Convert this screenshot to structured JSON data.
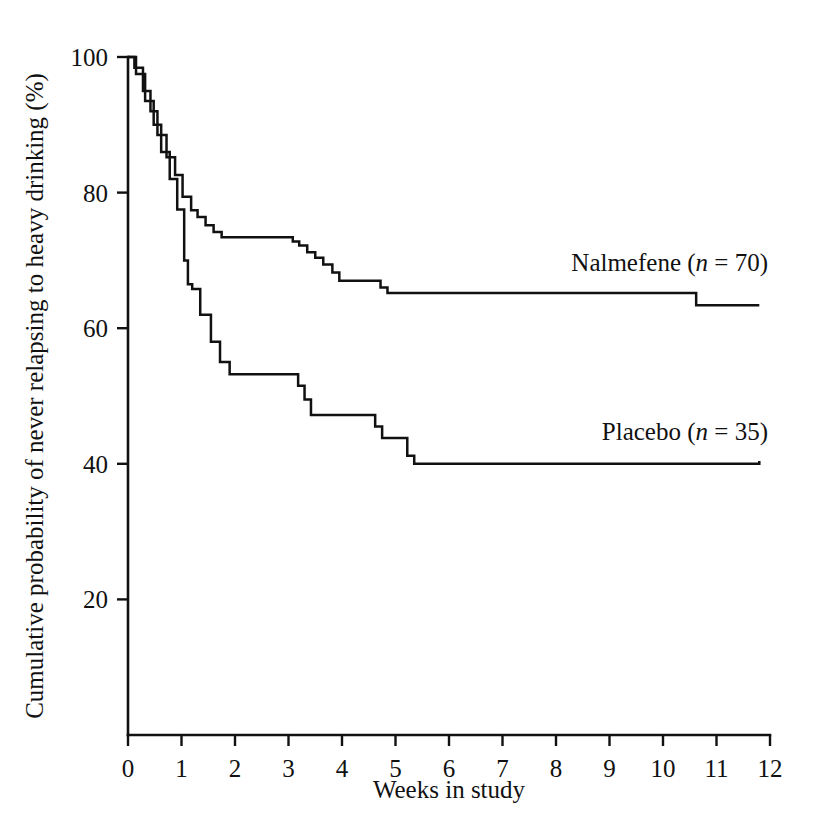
{
  "chart_data": {
    "type": "line",
    "title": "",
    "subtitle": "",
    "xlabel": "Weeks in study",
    "ylabel": "Cumulative probability of never relapsing to heavy drinking (%)",
    "xlim": [
      0,
      12
    ],
    "ylim": [
      0,
      100
    ],
    "xticks": [
      "0",
      "1",
      "2",
      "3",
      "4",
      "5",
      "6",
      "7",
      "8",
      "9",
      "10",
      "11",
      "12"
    ],
    "xtick_values": [
      0,
      1,
      2,
      3,
      4,
      5,
      6,
      7,
      8,
      9,
      10,
      11,
      12
    ],
    "yticks": [
      "20",
      "40",
      "60",
      "80",
      "100"
    ],
    "ytick_values": [
      20,
      40,
      60,
      80,
      100
    ],
    "grid": false,
    "legend_position": "inline-right-of-curve",
    "line_color": "#111111",
    "background_color": "#ffffff",
    "step_type": "post",
    "series": [
      {
        "name": "Nalmefene",
        "n": 70,
        "label": "Nalmefene (n = 70)",
        "label_prefix": "Nalmefene (",
        "label_italic": "n",
        "label_suffix": " = 70)",
        "label_x": 10.6,
        "label_y": 68.5,
        "final_value": 63.4,
        "x": [
          0.0,
          0.12,
          0.28,
          0.42,
          0.55,
          0.72,
          0.88,
          1.02,
          1.18,
          1.3,
          1.45,
          1.6,
          1.75,
          2.95,
          3.08,
          3.2,
          3.35,
          3.5,
          3.65,
          3.82,
          3.95,
          4.55,
          4.72,
          4.85,
          10.45,
          10.62,
          11.8
        ],
        "y": [
          100.0,
          98.4,
          95.0,
          92.0,
          88.5,
          85.2,
          82.6,
          79.4,
          77.4,
          76.4,
          75.2,
          74.2,
          73.4,
          73.4,
          72.8,
          72.2,
          71.2,
          70.4,
          69.4,
          68.2,
          67.0,
          67.0,
          66.0,
          65.2,
          65.2,
          63.4,
          63.4
        ]
      },
      {
        "name": "Placebo",
        "n": 35,
        "label": "Placebo (n = 35)",
        "label_prefix": "Placebo (",
        "label_italic": "n",
        "label_suffix": " = 35)",
        "label_x": 10.6,
        "label_y": 43.5,
        "final_value": 40.4,
        "x": [
          0.0,
          0.15,
          0.32,
          0.48,
          0.62,
          0.78,
          0.92,
          1.05,
          1.12,
          1.2,
          1.35,
          1.55,
          1.72,
          1.9,
          3.05,
          3.18,
          3.3,
          3.42,
          4.5,
          4.62,
          4.75,
          5.05,
          5.22,
          5.35,
          11.8
        ],
        "y": [
          100.0,
          97.5,
          93.5,
          90.0,
          86.0,
          82.0,
          77.5,
          70.0,
          66.5,
          65.8,
          62.0,
          58.0,
          55.0,
          53.2,
          53.2,
          51.5,
          49.5,
          47.2,
          47.2,
          45.5,
          43.8,
          43.8,
          41.2,
          40.0,
          40.4
        ]
      }
    ]
  },
  "axes": {
    "x_axis_title": "Weeks in study",
    "y_axis_title": "Cumulative probability of never relapsing to heavy drinking (%)"
  }
}
